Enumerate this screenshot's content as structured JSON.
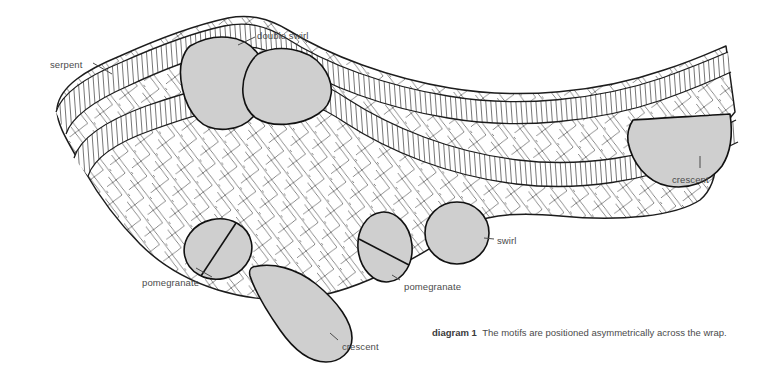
{
  "diagram": {
    "kind": "technical-illustration",
    "background_color": "#ffffff",
    "motif_fill_color": "#cfcfcf",
    "outline_color": "#1c1c1c",
    "label_color": "#4b4b4b"
  },
  "labels": [
    {
      "id": "serpent",
      "text": "serpent",
      "x": 50,
      "y": 59
    },
    {
      "id": "double-swirl",
      "text": "double swirl",
      "x": 257,
      "y": 30
    },
    {
      "id": "crescent-right",
      "text": "crescent",
      "x": 672,
      "y": 174
    },
    {
      "id": "swirl",
      "text": "swirl",
      "x": 497,
      "y": 235
    },
    {
      "id": "pomegranate-left",
      "text": "pomegranate",
      "x": 142,
      "y": 277
    },
    {
      "id": "pomegranate-mid",
      "text": "pomegranate",
      "x": 404,
      "y": 281
    },
    {
      "id": "crescent-bottom",
      "text": "crescent",
      "x": 342,
      "y": 341
    }
  ],
  "caption": {
    "number": "diagram 1",
    "text": "The motifs are positioned asymmetrically across the wrap.",
    "x": 432,
    "y": 327
  },
  "motifs": [
    {
      "id": "double-swirl-left",
      "name": "double swirl (left lobe)",
      "shape": "rounded-lobe"
    },
    {
      "id": "double-swirl-right",
      "name": "double swirl (right lobe)",
      "shape": "rounded-lobe"
    },
    {
      "id": "crescent-right",
      "name": "crescent",
      "shape": "half-disc"
    },
    {
      "id": "swirl",
      "name": "swirl",
      "shape": "circle"
    },
    {
      "id": "pomegranate-left",
      "name": "pomegranate",
      "shape": "divided-ellipse"
    },
    {
      "id": "pomegranate-mid",
      "name": "pomegranate",
      "shape": "divided-ellipse"
    },
    {
      "id": "crescent-bottom",
      "name": "crescent",
      "shape": "teardrop"
    }
  ],
  "bands": [
    {
      "id": "band-upper",
      "name": "serpent band (upper)"
    },
    {
      "id": "band-lower",
      "name": "serpent band (lower)"
    }
  ]
}
